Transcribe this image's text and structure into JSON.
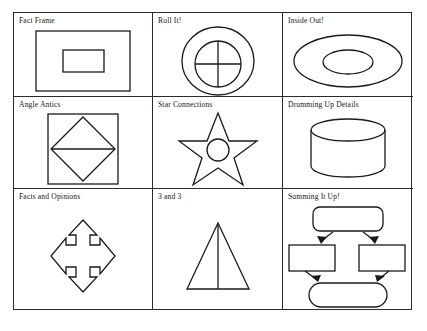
{
  "worksheet": {
    "title": "Graphic organizer shapes worksheet grid",
    "ink_color": "#1a1a1a",
    "background_color": "#ffffff",
    "cells": [
      {
        "label": "Fact Frame",
        "figure": "nested-rectangles-shape"
      },
      {
        "label": "Roll It!",
        "figure": "circle-in-circle-crosshair-shape"
      },
      {
        "label": "Inside Out!",
        "figure": "nested-ellipses-shape"
      },
      {
        "label": "Angle Antics",
        "figure": "square-with-inscribed-diamond-shape"
      },
      {
        "label": "Star Connections",
        "figure": "five-point-star-with-center-circle-shape"
      },
      {
        "label": "Drumming Up Details",
        "figure": "cylinder-shape"
      },
      {
        "label": "Facts and Opinions",
        "figure": "four-way-arrow-shape"
      },
      {
        "label": "3 and 3",
        "figure": "triangle-with-center-line-shape"
      },
      {
        "label": "Summing It Up!",
        "figure": "flowchart-shape"
      }
    ]
  }
}
